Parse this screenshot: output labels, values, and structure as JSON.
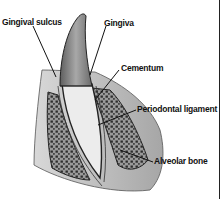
{
  "diagram": {
    "labels": {
      "gingival_sulcus": "Gingival sulcus",
      "gingiva": "Gingiva",
      "cementum": "Cementum",
      "periodontal_ligament": "Periodontal ligament",
      "alveolar_bone": "Alveolar bone"
    },
    "colors": {
      "background": "#ffffff",
      "ink": "#111111",
      "enamel": "#8c8c8c",
      "dentin": "#e8e8e8",
      "gum": "#bdbdbd",
      "bone_pattern": "#333333"
    }
  }
}
